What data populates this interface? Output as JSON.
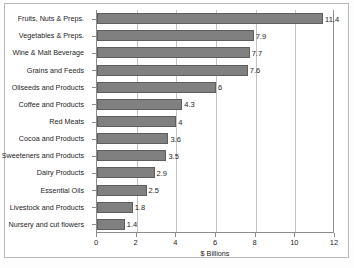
{
  "chart_data": {
    "type": "bar",
    "orientation": "horizontal",
    "title": "",
    "xlabel": "$ Billions",
    "ylabel": "",
    "xlim": [
      0,
      12
    ],
    "xticks": [
      "0",
      "2",
      "4",
      "6",
      "8",
      "10",
      "12"
    ],
    "grid": true,
    "legend": false,
    "bar_color": "#808080",
    "categories": [
      "Fruits, Nuts & Preps.",
      "Vegetables & Preps.",
      "Wine & Malt Beverage",
      "Grains and Feeds",
      "Oilseeds and Products",
      "Coffee and Products",
      "Red Meats",
      "Cocoa and Products",
      "Sweeteners and Products",
      "Dairy Products",
      "Essential Oils",
      "Livestock and Products",
      "Nursery and cut flowers"
    ],
    "values": [
      11.4,
      7.9,
      7.7,
      7.6,
      6,
      4.3,
      4,
      3.6,
      3.5,
      2.9,
      2.5,
      1.8,
      1.4
    ],
    "value_labels": [
      "11.4",
      "7.9",
      "7.7",
      "7.6",
      "6",
      "4.3",
      "4",
      "3.6",
      "3.5",
      "2.9",
      "2.5",
      "1.8",
      "1.4"
    ]
  }
}
